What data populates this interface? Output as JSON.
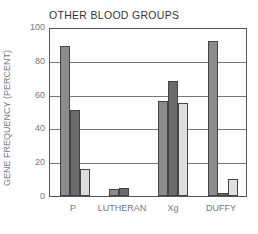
{
  "chart_data": {
    "type": "bar",
    "title": "OTHER BLOOD GROUPS",
    "xlabel": "",
    "ylabel": "GENE FREQUENCY (PERCENT)",
    "ylim": [
      0,
      100
    ],
    "yticks": [
      0,
      20,
      40,
      60,
      80,
      100
    ],
    "grid": true,
    "legend": null,
    "categories": [
      "P",
      "LUTHERAN",
      "Xg",
      "DUFFY"
    ],
    "series": [
      {
        "name": "series-1",
        "color": "#8c8c8c",
        "values": [
          89,
          4,
          56,
          92
        ]
      },
      {
        "name": "series-2",
        "color": "#6b6b6b",
        "values": [
          51,
          5,
          68,
          2
        ]
      },
      {
        "name": "series-3",
        "color": "#dedede",
        "values": [
          16,
          null,
          55,
          10
        ]
      }
    ]
  }
}
